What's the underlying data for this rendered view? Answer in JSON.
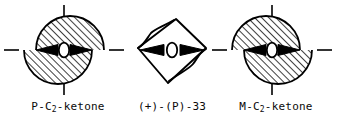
{
  "figure": {
    "background_color": "#ffffff",
    "line_color": "#000000",
    "hatch_color": "#000000",
    "panel_count": 3,
    "panels": [
      {
        "id": "p-c2-ketone",
        "caption_prefix": "P-C",
        "caption_subscript": "2",
        "caption_suffix": "-ketone",
        "caption_full": "P-C2-ketone",
        "descriptor": "P",
        "atom_label": "O",
        "shape": "offset-split-disc",
        "top_half_offset": "right",
        "bottom_half_offset": "left",
        "hatching": "diagonal-45",
        "axes": "dashed-crosshair",
        "wedges": 2
      },
      {
        "id": "plus-P-33",
        "caption_prefix": "(+)-(P)-33",
        "caption_subscript": "",
        "caption_suffix": "",
        "caption_full": "(+)-(P)-33",
        "descriptor": "(+)-(P)",
        "compound_number": "33",
        "atom_label": "O",
        "shape": "tilted-quadrilateral",
        "hatching": "none",
        "axes": "none",
        "wedges": 2
      },
      {
        "id": "m-c2-ketone",
        "caption_prefix": "M-C",
        "caption_subscript": "2",
        "caption_suffix": "-ketone",
        "caption_full": "M-C2-ketone",
        "descriptor": "M",
        "atom_label": "O",
        "shape": "offset-split-disc",
        "top_half_offset": "left",
        "bottom_half_offset": "right",
        "hatching": "diagonal-45",
        "axes": "dashed-crosshair",
        "wedges": 2
      }
    ]
  }
}
